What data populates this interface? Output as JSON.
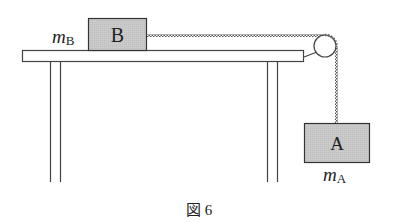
{
  "figure": {
    "caption": "図 6",
    "caption_prefix": "図",
    "caption_number": "6"
  },
  "blocks": {
    "B": {
      "label": "B",
      "mass_symbol": "m",
      "mass_subscript": "B",
      "position": "on table"
    },
    "A": {
      "label": "A",
      "mass_symbol": "m",
      "mass_subscript": "A",
      "position": "hanging"
    }
  },
  "elements": {
    "table": "horizontal table with four legs",
    "pulley": "pulley at right edge of table",
    "rope": "string connecting B over pulley to A"
  },
  "colors": {
    "block_fill": "#c8c8c8",
    "line": "#333333",
    "background": "#ffffff"
  }
}
